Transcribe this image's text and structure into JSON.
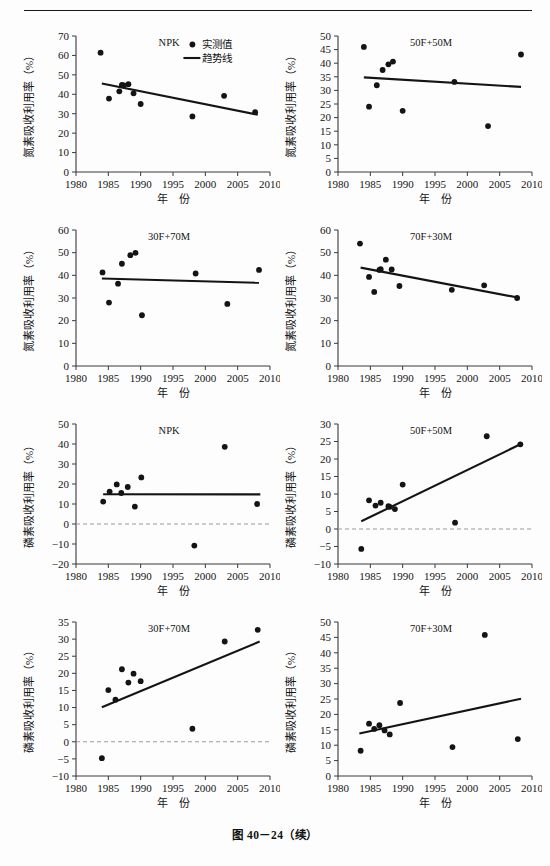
{
  "figure": {
    "caption": "图 40－24（续）",
    "axis_x_label": "年　份",
    "axis_y_label_n": "氮素吸收利用率（%）",
    "axis_y_label_p": "磷素吸收利用率（%）",
    "legend": {
      "observed": "实测值",
      "trend": "趋势线"
    },
    "colors": {
      "ink": "#141414",
      "axis": "#3a3a3a",
      "zero_line": "#9a9a9a"
    }
  },
  "chart_data": [
    {
      "id": "n-npk",
      "type": "scatter",
      "title": "NPK",
      "xlabel": "年　份",
      "ylabel": "氮素吸收利用率（%）",
      "xlim": [
        1980,
        2010
      ],
      "ylim": [
        0,
        70
      ],
      "xticks": [
        1980,
        1985,
        1990,
        1995,
        2000,
        2005,
        2010
      ],
      "yticks": [
        0,
        10,
        20,
        30,
        40,
        50,
        60,
        70
      ],
      "grid": false,
      "legend_position": "top-right",
      "has_legend": true,
      "zero_line": false,
      "points": [
        {
          "x": 1983.8,
          "y": 61.4
        },
        {
          "x": 1985.1,
          "y": 37.8
        },
        {
          "x": 1986.7,
          "y": 41.5
        },
        {
          "x": 1987.1,
          "y": 44.8
        },
        {
          "x": 1987.4,
          "y": 44.6
        },
        {
          "x": 1988.1,
          "y": 45.2
        },
        {
          "x": 1988.9,
          "y": 40.5
        },
        {
          "x": 1990.0,
          "y": 35.0
        },
        {
          "x": 1998.0,
          "y": 28.6
        },
        {
          "x": 2002.9,
          "y": 39.2
        },
        {
          "x": 2007.7,
          "y": 30.8
        }
      ],
      "trend": {
        "x1": 1984.0,
        "y1": 45.6,
        "x2": 2008.1,
        "y2": 29.5
      }
    },
    {
      "id": "n-50f50m",
      "type": "scatter",
      "title": "50F+50M",
      "xlabel": "年　份",
      "ylabel": "氮素吸收利用率（%）",
      "xlim": [
        1980,
        2010
      ],
      "ylim": [
        0,
        50
      ],
      "xticks": [
        1980,
        1985,
        1990,
        1995,
        2000,
        2005,
        2010
      ],
      "yticks": [
        0,
        5,
        10,
        15,
        20,
        25,
        30,
        35,
        40,
        45,
        50
      ],
      "grid": false,
      "has_legend": false,
      "zero_line": false,
      "points": [
        {
          "x": 1984.0,
          "y": 46.0
        },
        {
          "x": 1984.8,
          "y": 24.0
        },
        {
          "x": 1986.0,
          "y": 31.9
        },
        {
          "x": 1986.9,
          "y": 37.5
        },
        {
          "x": 1987.8,
          "y": 39.6
        },
        {
          "x": 1988.5,
          "y": 40.6
        },
        {
          "x": 1990.0,
          "y": 22.5
        },
        {
          "x": 1998.0,
          "y": 33.1
        },
        {
          "x": 2003.2,
          "y": 16.9
        },
        {
          "x": 2008.3,
          "y": 43.2
        }
      ],
      "trend": {
        "x1": 1984.0,
        "y1": 34.8,
        "x2": 2008.3,
        "y2": 31.3
      }
    },
    {
      "id": "n-30f70m",
      "type": "scatter",
      "title": "30F+70M",
      "xlabel": "年　份",
      "ylabel": "氮素吸收利用率（%）",
      "xlim": [
        1980,
        2010
      ],
      "ylim": [
        0,
        60
      ],
      "xticks": [
        1980,
        1985,
        1990,
        1995,
        2000,
        2005,
        2010
      ],
      "yticks": [
        0,
        10,
        20,
        30,
        40,
        50,
        60
      ],
      "grid": false,
      "has_legend": false,
      "zero_line": false,
      "points": [
        {
          "x": 1984.1,
          "y": 41.3
        },
        {
          "x": 1985.1,
          "y": 28.0
        },
        {
          "x": 1986.5,
          "y": 36.3
        },
        {
          "x": 1987.1,
          "y": 45.1
        },
        {
          "x": 1988.4,
          "y": 48.9
        },
        {
          "x": 1989.2,
          "y": 49.9
        },
        {
          "x": 1990.2,
          "y": 22.4
        },
        {
          "x": 1998.5,
          "y": 40.8
        },
        {
          "x": 2003.4,
          "y": 27.4
        },
        {
          "x": 2008.3,
          "y": 42.4
        }
      ],
      "trend": {
        "x1": 1984.0,
        "y1": 38.6,
        "x2": 2008.3,
        "y2": 36.7
      }
    },
    {
      "id": "n-70f30m",
      "type": "scatter",
      "title": "70F+30M",
      "xlabel": "年　份",
      "ylabel": "氮素吸收利用率（%）",
      "xlim": [
        1980,
        2010
      ],
      "ylim": [
        0,
        60
      ],
      "xticks": [
        1980,
        1985,
        1990,
        1995,
        2000,
        2005,
        2010
      ],
      "yticks": [
        0,
        10,
        20,
        30,
        40,
        50,
        60
      ],
      "grid": false,
      "has_legend": false,
      "zero_line": false,
      "points": [
        {
          "x": 1983.4,
          "y": 54.0
        },
        {
          "x": 1984.8,
          "y": 39.3
        },
        {
          "x": 1985.6,
          "y": 32.7
        },
        {
          "x": 1986.4,
          "y": 42.4
        },
        {
          "x": 1986.6,
          "y": 42.7
        },
        {
          "x": 1987.4,
          "y": 46.9
        },
        {
          "x": 1988.3,
          "y": 42.6
        },
        {
          "x": 1989.5,
          "y": 35.3
        },
        {
          "x": 1997.6,
          "y": 33.6
        },
        {
          "x": 2002.6,
          "y": 35.6
        },
        {
          "x": 2007.7,
          "y": 30.0
        }
      ],
      "trend": {
        "x1": 1983.5,
        "y1": 43.4,
        "x2": 2007.8,
        "y2": 30.2
      }
    },
    {
      "id": "p-npk",
      "type": "scatter",
      "title": "NPK",
      "xlabel": "年　份",
      "ylabel": "磷素吸收利用率（%）",
      "xlim": [
        1980,
        2010
      ],
      "ylim": [
        -20,
        50
      ],
      "xticks": [
        1980,
        1985,
        1990,
        1995,
        2000,
        2005,
        2010
      ],
      "yticks": [
        -20,
        -10,
        0,
        10,
        20,
        30,
        40,
        50
      ],
      "grid": false,
      "has_legend": false,
      "zero_line": true,
      "points": [
        {
          "x": 1984.2,
          "y": 11.2
        },
        {
          "x": 1985.2,
          "y": 16.2
        },
        {
          "x": 1986.3,
          "y": 19.8
        },
        {
          "x": 1987.0,
          "y": 15.5
        },
        {
          "x": 1988.0,
          "y": 18.5
        },
        {
          "x": 1989.1,
          "y": 8.7
        },
        {
          "x": 1990.1,
          "y": 23.3
        },
        {
          "x": 1998.3,
          "y": -10.8
        },
        {
          "x": 2003.0,
          "y": 38.6
        },
        {
          "x": 2008.0,
          "y": 10.0
        }
      ],
      "trend": {
        "x1": 1984.2,
        "y1": 14.9,
        "x2": 2008.5,
        "y2": 14.8
      }
    },
    {
      "id": "p-50f50m",
      "type": "scatter",
      "title": "50F+50M",
      "xlabel": "年　份",
      "ylabel": "磷素吸收利用率（%）",
      "xlim": [
        1980,
        2010
      ],
      "ylim": [
        -10,
        30
      ],
      "xticks": [
        1980,
        1985,
        1990,
        1995,
        2000,
        2005,
        2010
      ],
      "yticks": [
        -10,
        -5,
        0,
        5,
        10,
        15,
        20,
        25,
        30
      ],
      "grid": false,
      "has_legend": false,
      "zero_line": true,
      "points": [
        {
          "x": 1983.6,
          "y": -5.7
        },
        {
          "x": 1984.8,
          "y": 8.2
        },
        {
          "x": 1985.8,
          "y": 6.7
        },
        {
          "x": 1986.6,
          "y": 7.5
        },
        {
          "x": 1987.8,
          "y": 6.5
        },
        {
          "x": 1988.0,
          "y": 6.3
        },
        {
          "x": 1988.8,
          "y": 5.7
        },
        {
          "x": 1990.0,
          "y": 12.7
        },
        {
          "x": 1998.1,
          "y": 1.8
        },
        {
          "x": 2003.0,
          "y": 26.5
        },
        {
          "x": 2008.2,
          "y": 24.2
        }
      ],
      "trend": {
        "x1": 1983.6,
        "y1": 2.2,
        "x2": 2008.2,
        "y2": 24.2
      }
    },
    {
      "id": "p-30f70m",
      "type": "scatter",
      "title": "30F+70M",
      "xlabel": "年　份",
      "ylabel": "磷素吸收利用率（%）",
      "xlim": [
        1980,
        2010
      ],
      "ylim": [
        -10,
        35
      ],
      "xticks": [
        1980,
        1985,
        1990,
        1995,
        2000,
        2005,
        2010
      ],
      "yticks": [
        -10,
        -5,
        0,
        5,
        10,
        15,
        20,
        25,
        30,
        35
      ],
      "grid": false,
      "has_legend": false,
      "zero_line": true,
      "points": [
        {
          "x": 1984.0,
          "y": -4.8
        },
        {
          "x": 1985.0,
          "y": 15.1
        },
        {
          "x": 1986.1,
          "y": 12.3
        },
        {
          "x": 1987.1,
          "y": 21.2
        },
        {
          "x": 1988.1,
          "y": 17.3
        },
        {
          "x": 1988.9,
          "y": 19.9
        },
        {
          "x": 1990.0,
          "y": 17.7
        },
        {
          "x": 1998.0,
          "y": 3.8
        },
        {
          "x": 2003.0,
          "y": 29.3
        },
        {
          "x": 2008.1,
          "y": 32.7
        }
      ],
      "trend": {
        "x1": 1984.0,
        "y1": 10.1,
        "x2": 2008.4,
        "y2": 29.3
      }
    },
    {
      "id": "p-70f30m",
      "type": "scatter",
      "title": "70F+30M",
      "xlabel": "年　份",
      "ylabel": "磷素吸收利用率（%）",
      "xlim": [
        1980,
        2010
      ],
      "ylim": [
        0,
        50
      ],
      "xticks": [
        1980,
        1985,
        1990,
        1995,
        2000,
        2005,
        2010
      ],
      "yticks": [
        0,
        5,
        10,
        15,
        20,
        25,
        30,
        35,
        40,
        45,
        50
      ],
      "grid": false,
      "has_legend": false,
      "zero_line": false,
      "points": [
        {
          "x": 1983.5,
          "y": 8.2
        },
        {
          "x": 1984.8,
          "y": 17.0
        },
        {
          "x": 1985.6,
          "y": 15.3
        },
        {
          "x": 1986.4,
          "y": 16.5
        },
        {
          "x": 1987.2,
          "y": 14.8
        },
        {
          "x": 1988.0,
          "y": 13.5
        },
        {
          "x": 1989.6,
          "y": 23.7
        },
        {
          "x": 1997.7,
          "y": 9.4
        },
        {
          "x": 2002.7,
          "y": 45.8
        },
        {
          "x": 2007.8,
          "y": 12.0
        }
      ],
      "trend": {
        "x1": 1983.3,
        "y1": 13.8,
        "x2": 2008.3,
        "y2": 25.1
      }
    }
  ],
  "layout": {
    "cells": [
      {
        "id": "n-npk",
        "left": 18,
        "top": 22,
        "width": 262,
        "height": 192
      },
      {
        "id": "n-50f50m",
        "left": 280,
        "top": 22,
        "width": 262,
        "height": 192
      },
      {
        "id": "n-30f70m",
        "left": 18,
        "top": 216,
        "width": 262,
        "height": 192
      },
      {
        "id": "n-70f30m",
        "left": 280,
        "top": 216,
        "width": 262,
        "height": 192
      },
      {
        "id": "p-npk",
        "left": 18,
        "top": 410,
        "width": 262,
        "height": 196
      },
      {
        "id": "p-50f50m",
        "left": 280,
        "top": 410,
        "width": 262,
        "height": 196
      },
      {
        "id": "p-30f70m",
        "left": 18,
        "top": 608,
        "width": 262,
        "height": 210
      },
      {
        "id": "p-70f30m",
        "left": 280,
        "top": 608,
        "width": 262,
        "height": 210
      }
    ]
  }
}
